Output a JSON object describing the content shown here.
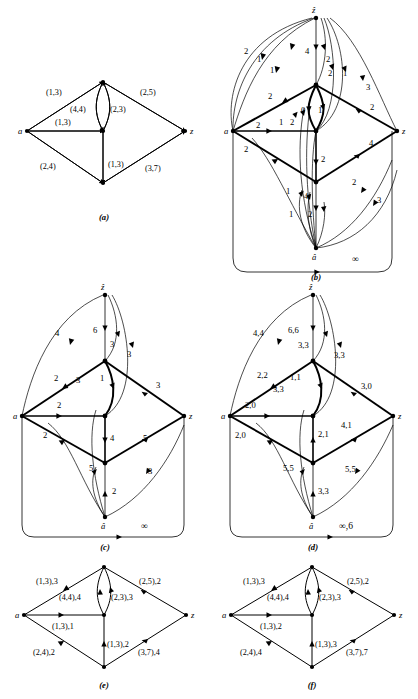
{
  "figure": {
    "background": "#ffffff",
    "stroke": "#000000",
    "panels": [
      {
        "id": "a",
        "caption": "(a)",
        "node_labels": {
          "left": "a",
          "right": "z"
        },
        "edge_labels": [
          "(1,3)",
          "(2,5)",
          "(4,4)",
          "(2,3)",
          "(1,3)",
          "(2,4)",
          "(1,3)",
          "(3,7)"
        ]
      },
      {
        "id": "b",
        "caption": "(b)",
        "node_labels": {
          "left": "a",
          "right": "z",
          "top": "ẑ",
          "bottom": "â"
        },
        "edge_labels": [
          "2",
          "1",
          "1",
          "4",
          "2",
          "2",
          "1",
          "3",
          "2",
          "2",
          "1",
          "2",
          "0",
          "1",
          "3",
          "2",
          "2",
          "2",
          "1",
          "4",
          "1",
          "2",
          "2",
          "3",
          "4"
        ],
        "infinity_label": "∞"
      },
      {
        "id": "c",
        "caption": "(c)",
        "node_labels": {
          "left": "a",
          "right": "z",
          "top": "ẑ",
          "bottom": "â"
        },
        "edge_labels": [
          "4",
          "6",
          "3",
          "3",
          "2",
          "3",
          "1",
          "3",
          "2",
          "2",
          "2",
          "4",
          "5",
          "5",
          "3"
        ],
        "infinity_label": "∞"
      },
      {
        "id": "d",
        "caption": "(d)",
        "node_labels": {
          "left": "a",
          "right": "z",
          "top": "ẑ",
          "bottom": "â"
        },
        "edge_labels": [
          "4,4",
          "6,6",
          "3,3",
          "3,3",
          "2,2",
          "3,3",
          "1,1",
          "3,0",
          "2,0",
          "2,0",
          "2,1",
          "4,1",
          "5,5",
          "5,5",
          "3,3"
        ],
        "infinity_label": "∞,6"
      },
      {
        "id": "e",
        "caption": "(e)",
        "node_labels": {
          "left": "a",
          "right": "z"
        },
        "edge_labels": [
          "(1,3),3",
          "(2,5),2",
          "(4,4),4",
          "(2,3),3",
          "(1,3),1",
          "(2,4),2",
          "(1,3),2",
          "(3,7),4"
        ]
      },
      {
        "id": "f",
        "caption": "(f)",
        "node_labels": {
          "left": "a",
          "right": "z"
        },
        "edge_labels": [
          "(1,3),3",
          "(2,5),2",
          "(4,4),4",
          "(2,3),3",
          "(1,3),2",
          "(2,4),4",
          "(1,3),3",
          "(3,7),7"
        ]
      }
    ]
  }
}
